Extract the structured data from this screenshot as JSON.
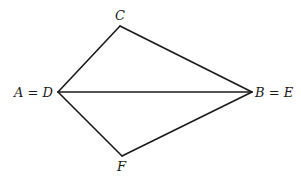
{
  "diagram": {
    "type": "geometric-figure",
    "vertices": {
      "AD": {
        "label": "A = D",
        "x": 58,
        "y": 92
      },
      "C": {
        "label": "C",
        "x": 120,
        "y": 26
      },
      "BE": {
        "label": "B = E",
        "x": 252,
        "y": 92
      },
      "F": {
        "label": "F",
        "x": 122,
        "y": 156
      }
    },
    "edges": [
      {
        "from": "AD",
        "to": "C"
      },
      {
        "from": "C",
        "to": "BE"
      },
      {
        "from": "AD",
        "to": "BE"
      },
      {
        "from": "AD",
        "to": "F"
      },
      {
        "from": "F",
        "to": "BE"
      }
    ],
    "labels": {
      "ad": "A = D",
      "c": "C",
      "be": "B = E",
      "f": "F"
    },
    "colors": {
      "stroke": "#1a1a1a",
      "background": "#ffffff"
    }
  }
}
